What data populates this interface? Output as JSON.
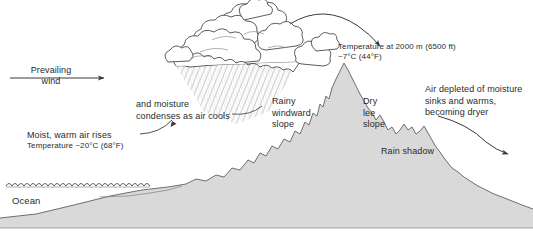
{
  "figure": {
    "background_color": "#ffffff",
    "terrain_fill": "#d9d9d9",
    "line_color": "#3a3a3a",
    "text_color": "#2b2b2b"
  },
  "labels": {
    "prevailing_wind": "Prevailing\nwind",
    "moisture_condenses": "and moisture\ncondenses as air cools",
    "moist_warm_air": "Moist, warm air rises",
    "temp_sea_level": "Temperature ~20°C (68°F)",
    "ocean": "Ocean",
    "temp_summit_line1": "Temperature at 2000 m (6500 ft)",
    "temp_summit_line2": "~7°C (44°F)",
    "rainy_windward": "Rainy\nwindward\nslope",
    "dry_lee": "Dry\nlee\nslope",
    "rain_shadow": "Rain shadow",
    "air_depleted": "Air depleted of moisture\nsinks and warms,\nbecoming dryer"
  },
  "annotations": {
    "elevation_m": 2000,
    "elevation_ft": 6500,
    "summit_temp_c": 7,
    "summit_temp_f": 44,
    "sea_level_temp_c": 20,
    "sea_level_temp_f": 68
  },
  "icons": {
    "wind_arrow": "wind-arrow-icon",
    "summit_arrow": "summit-curved-arrow-icon",
    "descending_arrow": "descending-curved-arrow-icon",
    "leader_line": "leader-line-icon",
    "cloud": "cloud-icon",
    "rain": "rain-hatching-icon",
    "ocean_waves": "ocean-waves-icon",
    "mountain": "mountain-icon"
  }
}
